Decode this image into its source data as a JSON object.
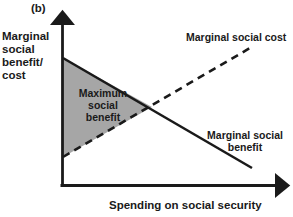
{
  "figure": {
    "panel_label": "(b)",
    "y_axis_label": "Marginal\nsocial\nbenefit/\ncost",
    "x_axis_label": "Spending on social security",
    "area_label": "Maximum\nsocial\nbenefit",
    "msc_label": "Marginal social cost",
    "msb_label": "Marginal social\nbenefit"
  },
  "colors": {
    "line": "#1a1a1a",
    "axis": "#1a1a1a",
    "shaded_area_fill": "#a6a6a6",
    "background": "#ffffff",
    "text": "#1a1a1a"
  },
  "chart_data": {
    "type": "line",
    "title": "",
    "xlabel": "Spending on social security",
    "ylabel": "Marginal social benefit/ cost",
    "grid": false,
    "legend": "inline-annotations",
    "axis_origin_px": [
      62,
      186
    ],
    "axis_x_end_px": [
      286,
      186
    ],
    "axis_y_end_px": [
      62,
      14
    ],
    "series": [
      {
        "name": "Marginal social benefit",
        "style": "solid",
        "points_px": [
          [
            63,
            58
          ],
          [
            252,
            168
          ]
        ],
        "description": "Downward sloping line starting high on the vertical axis and falling as spending increases"
      },
      {
        "name": "Marginal social cost",
        "style": "dashed",
        "points_px": [
          [
            63,
            157
          ],
          [
            250,
            48
          ]
        ],
        "description": "Upward sloping dashed line starting low on the vertical axis and rising as spending increases"
      }
    ],
    "shaded_region": {
      "label": "Maximum social benefit",
      "vertices_px": [
        [
          63,
          58
        ],
        [
          63,
          157
        ],
        [
          152,
          107
        ]
      ],
      "fill": "#a6a6a6",
      "description": "Triangle between the marginal social benefit and marginal social cost curves up to their intersection"
    },
    "intersection_px": [
      152,
      107
    ],
    "annotations": [
      {
        "text": "Marginal social cost",
        "position_px": [
          186,
          32
        ]
      },
      {
        "text": "Marginal social benefit",
        "position_px": [
          205,
          130
        ]
      },
      {
        "text": "Maximum social benefit",
        "position_px": [
          103,
          107
        ]
      }
    ]
  }
}
